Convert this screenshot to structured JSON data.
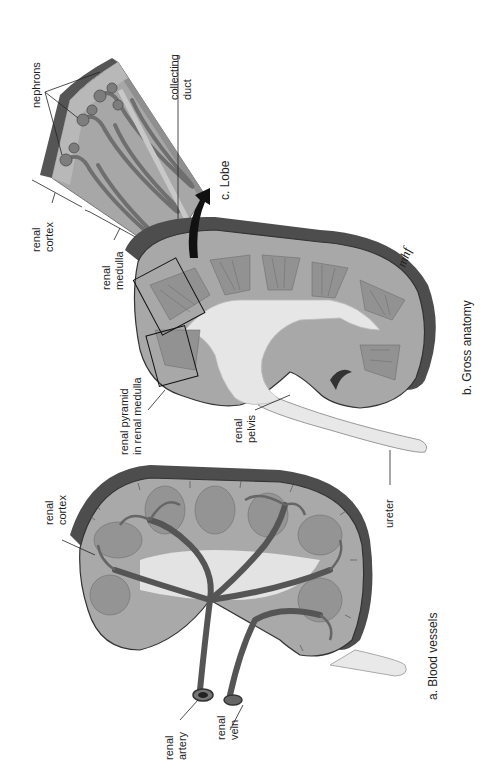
{
  "figure": {
    "orientation": "rotated 90deg counter-clockwise",
    "panels": [
      {
        "id": "a",
        "caption": "a. Blood vessels",
        "labels": [
          {
            "id": "renal-cortex-a",
            "lines": [
              "renal",
              "cortex"
            ]
          },
          {
            "id": "renal-artery",
            "lines": [
              "renal",
              "artery"
            ]
          },
          {
            "id": "renal-vein",
            "lines": [
              "renal",
              "vein"
            ]
          }
        ]
      },
      {
        "id": "b",
        "caption": "b. Gross anatomy",
        "labels": [
          {
            "id": "renal-pyramid",
            "lines": [
              "renal pyramid",
              "in renal medulla"
            ]
          },
          {
            "id": "renal-pelvis",
            "lines": [
              "renal",
              "pelvis"
            ]
          },
          {
            "id": "ureter",
            "lines": [
              "ureter"
            ]
          }
        ],
        "signature": "mhf"
      },
      {
        "id": "c",
        "caption": "c. Lobe",
        "labels": [
          {
            "id": "renal-cortex-c",
            "lines": [
              "renal",
              "cortex"
            ]
          },
          {
            "id": "renal-medulla",
            "lines": [
              "renal",
              "medulla"
            ]
          },
          {
            "id": "nephrons",
            "lines": [
              "nephrons"
            ]
          },
          {
            "id": "collecting-duct",
            "lines": [
              "collecting",
              "duct"
            ]
          }
        ]
      }
    ],
    "colors": {
      "capsule": "#4a4a4a",
      "cortex": "#a9a9a9",
      "pyramid": "#8c8c8c",
      "pelvis": "#e4e4e4",
      "vessel": "#5a5a5a",
      "background": "#ffffff"
    }
  }
}
